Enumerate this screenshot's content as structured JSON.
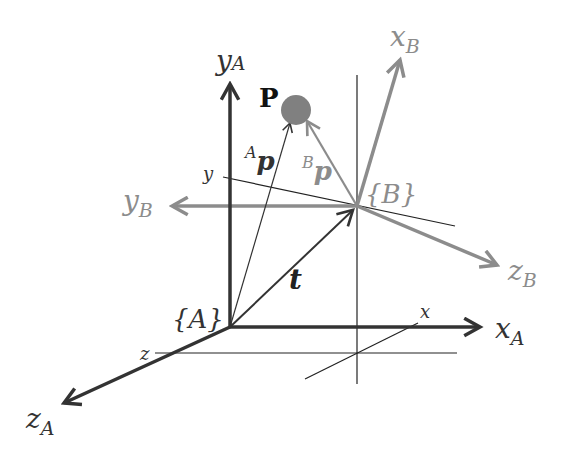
{
  "colors": {
    "frame_a": "#333333",
    "frame_b": "#8c8c8c",
    "guide": "#222222",
    "point": "#808080"
  },
  "labels": {
    "point": "P",
    "frame_a": "{A}",
    "frame_b": "{B}",
    "x_a": "x",
    "x_a_sub": "A",
    "y_a": "y",
    "y_a_sub": "A",
    "z_a": "z",
    "z_a_sub": "A",
    "x_b": "x",
    "x_b_sub": "B",
    "y_b": "y",
    "y_b_sub": "B",
    "z_b": "z",
    "z_b_sub": "B",
    "vec_ap_sup": "A",
    "vec_ap": "p",
    "vec_bp_sup": "B",
    "vec_bp": "p",
    "translation": "t",
    "tick_x": "x",
    "tick_y": "y",
    "tick_z": "z"
  }
}
